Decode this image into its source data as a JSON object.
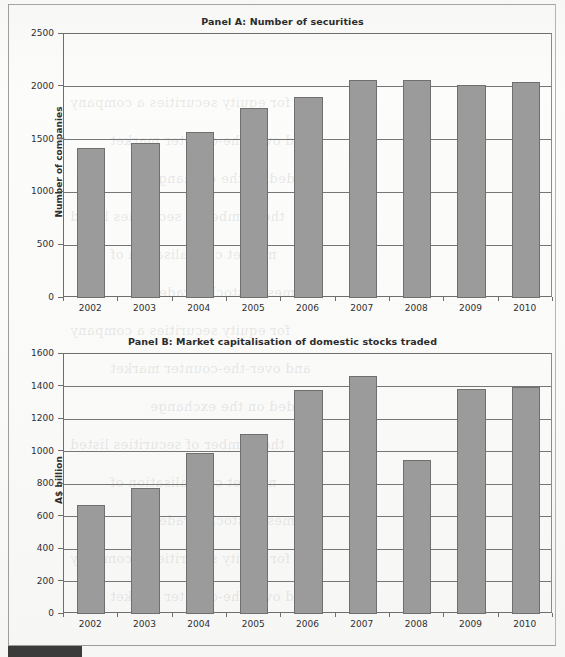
{
  "page": {
    "bottom_tab_color": "#3b3b3b",
    "bar_fill_color": "#9b9b9b",
    "bar_border_color": "#6f6f6f",
    "axis_color": "#6e6e6e",
    "ghost_text": [
      "for equity securities a company",
      "and over-the-counter market",
      "traded on the exchange",
      "the number of securities listed",
      "market capitalisation of",
      "domestic stocks traded"
    ]
  },
  "chart_data": [
    {
      "type": "bar",
      "title": "Panel A: Number of securities",
      "xlabel": "",
      "ylabel": "Number of companies",
      "categories": [
        "2002",
        "2003",
        "2004",
        "2005",
        "2006",
        "2007",
        "2008",
        "2009",
        "2010"
      ],
      "values": [
        1425,
        1470,
        1570,
        1800,
        1900,
        2060,
        2065,
        2020,
        2045
      ],
      "yticks": [
        0,
        500,
        1000,
        1500,
        2000,
        2500
      ],
      "ylim": [
        0,
        2500
      ],
      "grid": true,
      "legend": "none"
    },
    {
      "type": "bar",
      "title": "Panel B: Market capitalisation of domestic stocks traded",
      "xlabel": "",
      "ylabel": "A$ billion",
      "categories": [
        "2002",
        "2003",
        "2004",
        "2005",
        "2006",
        "2007",
        "2008",
        "2009",
        "2010"
      ],
      "values": [
        670,
        775,
        990,
        1105,
        1380,
        1465,
        950,
        1385,
        1400
      ],
      "yticks": [
        0,
        200,
        400,
        600,
        800,
        1000,
        1200,
        1400,
        1600
      ],
      "ylim": [
        0,
        1600
      ],
      "grid": true,
      "legend": "none"
    }
  ]
}
